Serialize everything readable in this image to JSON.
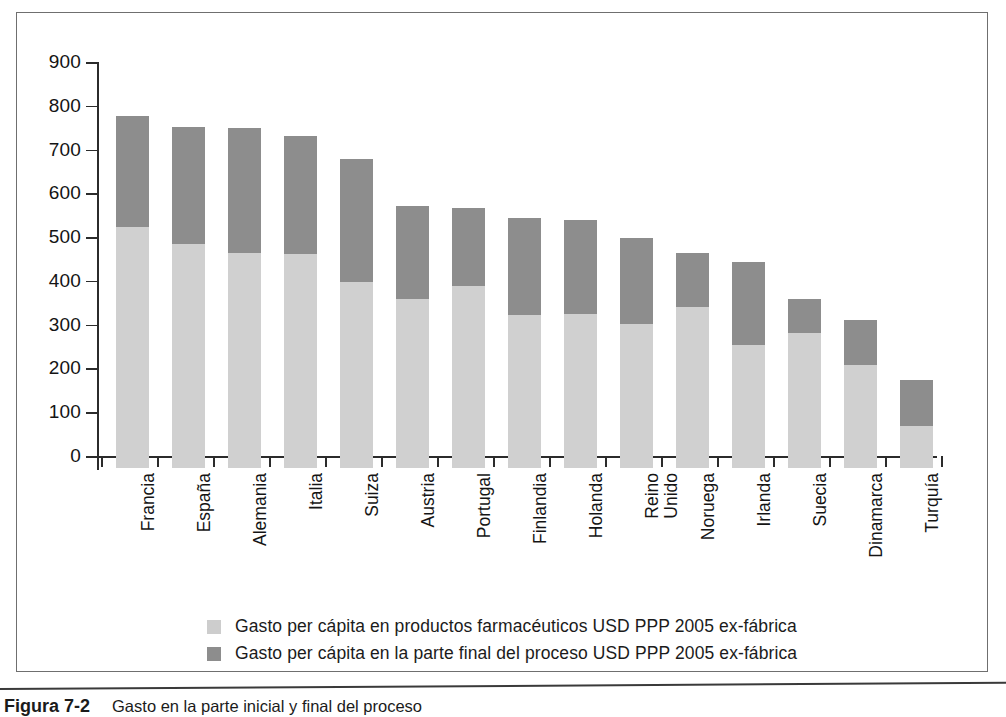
{
  "figure": {
    "caption_number": "Figura 7-2",
    "caption_text": "Gasto en la parte inicial y final del proceso"
  },
  "legend": {
    "items": [
      {
        "swatch": "light-gray-swatch",
        "color": "#cdcdcd",
        "label": "Gasto per cápita en productos farmacéuticos USD PPP 2005 ex-fábrica"
      },
      {
        "swatch": "dark-gray-swatch",
        "color": "#8d8d8d",
        "label": "Gasto per cápita en la parte final del proceso USD PPP 2005 ex-fábrica"
      }
    ]
  },
  "chart_data": {
    "type": "bar",
    "stacked": true,
    "title": "",
    "xlabel": "",
    "ylabel": "",
    "ylim": [
      0,
      900
    ],
    "yticks": [
      0,
      100,
      200,
      300,
      400,
      500,
      600,
      700,
      800,
      900
    ],
    "grid": false,
    "legend_position": "bottom",
    "colors": {
      "series1": "#cdcdcd",
      "series2": "#8d8d8d"
    },
    "categories": [
      "Francia",
      "España",
      "Alemania",
      "Italia",
      "Suiza",
      "Austria",
      "Portugal",
      "Finlandia",
      "Holanda",
      "Reino\nUnido",
      "Noruega",
      "Irlanda",
      "Suecia",
      "Dinamarca",
      "Turquía"
    ],
    "series": [
      {
        "name": "Gasto per cápita en productos farmacéuticos USD PPP 2005 ex-fábrica",
        "values": [
          550,
          512,
          492,
          490,
          425,
          385,
          415,
          350,
          352,
          330,
          368,
          282,
          308,
          235,
          95
        ]
      },
      {
        "name": "Gasto per cápita en la parte final del proceso USD PPP 2005 ex-fábrica",
        "values": [
          255,
          268,
          285,
          268,
          282,
          213,
          179,
          220,
          215,
          195,
          124,
          188,
          77,
          103,
          105
        ]
      }
    ],
    "totals": [
      805,
      780,
      777,
      758,
      707,
      598,
      594,
      570,
      567,
      525,
      492,
      470,
      385,
      338,
      200
    ]
  }
}
